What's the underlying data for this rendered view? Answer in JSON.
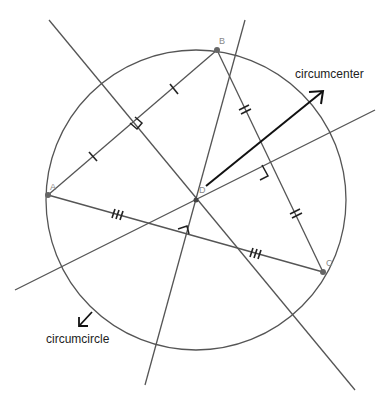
{
  "diagram": {
    "labels": {
      "circumcenter": "circumcenter",
      "circumcircle": "circumcircle"
    },
    "points": [
      {
        "name": "A",
        "x": 48,
        "y": 195
      },
      {
        "name": "B",
        "x": 217,
        "y": 50
      },
      {
        "name": "C",
        "x": 323,
        "y": 272
      },
      {
        "name": "D",
        "x": 196,
        "y": 200
      }
    ],
    "circle": {
      "cx": 196,
      "cy": 200,
      "r": 150
    },
    "perpendicular_bisectors": [
      {
        "of": "AB",
        "x1": 49,
        "y1": 20,
        "x2": 355,
        "y2": 390
      },
      {
        "of": "BC",
        "x1": 15,
        "y1": 290,
        "x2": 375,
        "y2": 110
      },
      {
        "of": "AC",
        "x1": 245,
        "y1": 20,
        "x2": 145,
        "y2": 385
      }
    ],
    "tick_marks": {
      "AB": 1,
      "BC": 2,
      "AC": 3
    },
    "colors": {
      "line": "#555555",
      "arrow": "#111111",
      "point": "#666666"
    }
  }
}
